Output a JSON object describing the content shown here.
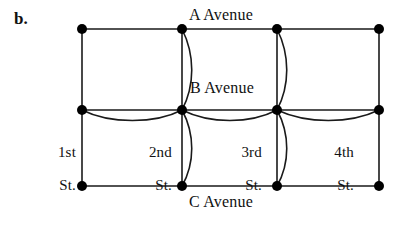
{
  "figure": {
    "part_label": "b.",
    "type": "street-multigraph-diagram"
  },
  "avenues": {
    "a": "A Avenue",
    "b": "B Avenue",
    "c": "C Avenue"
  },
  "streets": {
    "first": {
      "ordinal": "1st",
      "suffix": "St."
    },
    "second": {
      "ordinal": "2nd",
      "suffix": "St."
    },
    "third": {
      "ordinal": "3rd",
      "suffix": "St."
    },
    "fourth": {
      "ordinal": "4th",
      "suffix": "St."
    }
  },
  "colors": {
    "ink": "#000000",
    "background": "#ffffff",
    "vertex_fill": "#000000",
    "edge_stroke": "#1a1a1a"
  },
  "graph": {
    "rows": [
      "A Avenue",
      "B Avenue",
      "C Avenue"
    ],
    "columns": [
      "1st St.",
      "2nd St.",
      "3rd St.",
      "4th St."
    ],
    "vertex_count": 12,
    "vertex_radius": 5,
    "vertices": [
      {
        "name": "1st-A",
        "x": 82,
        "y": 29
      },
      {
        "name": "2nd-A",
        "x": 182,
        "y": 29
      },
      {
        "name": "3rd-A",
        "x": 277,
        "y": 29
      },
      {
        "name": "4th-A",
        "x": 379,
        "y": 29
      },
      {
        "name": "1st-B",
        "x": 82,
        "y": 110
      },
      {
        "name": "2nd-B",
        "x": 182,
        "y": 110
      },
      {
        "name": "3rd-B",
        "x": 277,
        "y": 110
      },
      {
        "name": "4th-B",
        "x": 379,
        "y": 110
      },
      {
        "name": "1st-C",
        "x": 82,
        "y": 186
      },
      {
        "name": "2nd-C",
        "x": 182,
        "y": 186
      },
      {
        "name": "3rd-C",
        "x": 277,
        "y": 186
      },
      {
        "name": "4th-C",
        "x": 379,
        "y": 186
      }
    ],
    "straight_edges": [
      {
        "name": "a-avenue-1st-2nd",
        "x1": 82,
        "y1": 29,
        "x2": 182,
        "y2": 29
      },
      {
        "name": "a-avenue-2nd-3rd",
        "x1": 182,
        "y1": 29,
        "x2": 277,
        "y2": 29
      },
      {
        "name": "a-avenue-3rd-4th",
        "x1": 277,
        "y1": 29,
        "x2": 379,
        "y2": 29
      },
      {
        "name": "b-avenue-1st-2nd",
        "x1": 82,
        "y1": 110,
        "x2": 182,
        "y2": 110
      },
      {
        "name": "b-avenue-2nd-3rd",
        "x1": 182,
        "y1": 110,
        "x2": 277,
        "y2": 110
      },
      {
        "name": "b-avenue-3rd-4th",
        "x1": 277,
        "y1": 110,
        "x2": 379,
        "y2": 110
      },
      {
        "name": "c-avenue-1st-2nd",
        "x1": 82,
        "y1": 186,
        "x2": 182,
        "y2": 186
      },
      {
        "name": "c-avenue-2nd-3rd",
        "x1": 182,
        "y1": 186,
        "x2": 277,
        "y2": 186
      },
      {
        "name": "c-avenue-3rd-4th",
        "x1": 277,
        "y1": 186,
        "x2": 379,
        "y2": 186
      },
      {
        "name": "1st-street-a-b",
        "x1": 82,
        "y1": 29,
        "x2": 82,
        "y2": 110
      },
      {
        "name": "1st-street-b-c",
        "x1": 82,
        "y1": 110,
        "x2": 82,
        "y2": 186
      },
      {
        "name": "2nd-street-a-b",
        "x1": 182,
        "y1": 29,
        "x2": 182,
        "y2": 110
      },
      {
        "name": "2nd-street-b-c",
        "x1": 182,
        "y1": 110,
        "x2": 182,
        "y2": 186
      },
      {
        "name": "3rd-street-a-b",
        "x1": 277,
        "y1": 29,
        "x2": 277,
        "y2": 110
      },
      {
        "name": "3rd-street-b-c",
        "x1": 277,
        "y1": 110,
        "x2": 277,
        "y2": 186
      },
      {
        "name": "4th-street-a-b",
        "x1": 379,
        "y1": 29,
        "x2": 379,
        "y2": 110
      },
      {
        "name": "4th-street-b-c",
        "x1": 379,
        "y1": 110,
        "x2": 379,
        "y2": 186
      }
    ],
    "curved_edges": [
      {
        "name": "2nd-street-a-b-parallel",
        "d": "M 182 29 C 195 55, 195 85, 182 110"
      },
      {
        "name": "2nd-street-b-c-parallel",
        "d": "M 182 110 C 195 134, 195 163, 182 186"
      },
      {
        "name": "3rd-street-a-b-parallel",
        "d": "M 277 29 C 290 55, 290 85, 277 110"
      },
      {
        "name": "3rd-street-b-c-parallel",
        "d": "M 277 110 C 290 134, 290 163, 277 186"
      },
      {
        "name": "b-avenue-1st-2nd-parallel",
        "d": "M 82 110 C 110 124, 155 124, 182 110"
      },
      {
        "name": "b-avenue-2nd-3rd-parallel",
        "d": "M 182 110 C 210 124, 250 124, 277 110"
      },
      {
        "name": "b-avenue-3rd-4th-parallel",
        "d": "M 277 110 C 307 124, 350 124, 379 110"
      }
    ]
  }
}
